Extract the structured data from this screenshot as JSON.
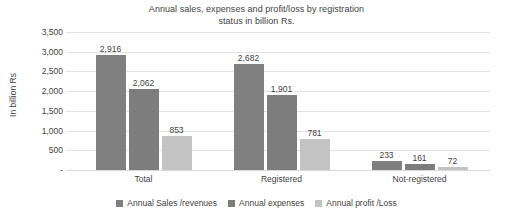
{
  "chart_data": {
    "type": "bar",
    "title": "Annual sales, expenses and profit/loss by registration status in billion Rs.",
    "title_line1": "Annual sales, expenses and profit/loss by registration",
    "title_line2": "status in billion Rs.",
    "xlabel": "",
    "ylabel": "In billion Rs",
    "categories": [
      "Total",
      "Registered",
      "Not-registered"
    ],
    "series": [
      {
        "name": "Annual Sales /revenues",
        "color": "#808080",
        "values": [
          2916,
          2062,
          233
        ],
        "labels": [
          "2,916",
          "2,062",
          "233"
        ]
      },
      {
        "name": "Annual expenses",
        "color": "#7d7d7d",
        "values": [
          2062,
          1901,
          161
        ],
        "labels": [
          "2,062",
          "1,901",
          "161"
        ]
      },
      {
        "name": "Annual profit /Loss",
        "color": "#c3c3c3",
        "values": [
          853,
          781,
          72
        ],
        "labels": [
          "853",
          "781",
          "72"
        ]
      }
    ],
    "note_series_mapping": "Group 1 (Total): 2,916 / 2,062 / 853 ; Group 2 (Registered): 2,682 / 1,901 / 781 ; Group 3 (Not-registered): 233 / 161 / 72",
    "grouped_values": [
      [
        2916,
        2062,
        853
      ],
      [
        2682,
        1901,
        781
      ],
      [
        233,
        161,
        72
      ]
    ],
    "grouped_labels": [
      [
        "2,916",
        "2,062",
        "853"
      ],
      [
        "2,682",
        "1,901",
        "781"
      ],
      [
        "233",
        "161",
        "72"
      ]
    ],
    "ylim": [
      0,
      3500
    ],
    "yticks": [
      0,
      500,
      1000,
      1500,
      2000,
      2500,
      3000,
      3500
    ],
    "ytick_labels": [
      "-",
      "500",
      "1,000",
      "1,500",
      "2,000",
      "2,500",
      "3,000",
      "3,500"
    ],
    "grid": true,
    "grid_color": "#e2e2e2",
    "legend_position": "bottom",
    "legend": [
      {
        "label": "Annual Sales /revenues",
        "color": "#808080"
      },
      {
        "label": "Annual expenses",
        "color": "#7d7d7d"
      },
      {
        "label": "Annual profit /Loss",
        "color": "#c3c3c3"
      }
    ],
    "background": "#ffffff",
    "text_color": "#3f3f3f"
  }
}
